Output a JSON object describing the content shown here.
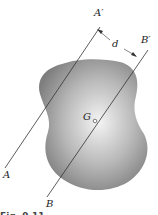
{
  "figure": {
    "labels": {
      "a_prime": "A′",
      "b_prime": "B′",
      "a": "A",
      "b": "B",
      "d": "d",
      "g": "G"
    },
    "caption": "Fig. 9.11",
    "colors": {
      "body_dark": "#8a8a8a",
      "body_light": "#f2f2f2",
      "line": "#333333"
    }
  }
}
